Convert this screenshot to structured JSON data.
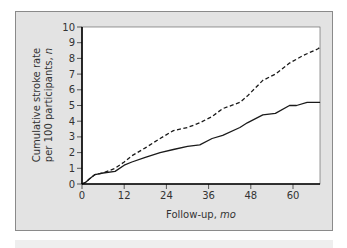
{
  "chart_data": {
    "type": "line",
    "title": "",
    "xlabel": "Follow-up, mo",
    "xlabel_main": "Follow-up, ",
    "xlabel_unit": "mo",
    "ylabel": "Cumulative stroke rate per 100 participants, n",
    "ylabel_line1": "Cumulative stroke rate",
    "ylabel_line2_main": "per 100 participants, ",
    "ylabel_line2_unit": "n",
    "xlim": [
      0,
      68
    ],
    "ylim": [
      0,
      10
    ],
    "x_ticks": [
      0,
      12,
      24,
      36,
      48,
      60
    ],
    "y_ticks": [
      0,
      1,
      2,
      3,
      4,
      5,
      6,
      7,
      8,
      9,
      10
    ],
    "grid": false,
    "legend": "none",
    "series": [
      {
        "name": "dashed",
        "style": "dashed",
        "x": [
          0,
          1,
          2,
          3.7,
          6,
          9.4,
          12,
          14.2,
          18,
          22.2,
          26,
          30,
          33.5,
          37,
          40,
          44.9,
          47,
          51.4,
          55,
          59,
          63,
          67,
          67.7
        ],
        "y": [
          0,
          0.1,
          0.3,
          0.6,
          0.7,
          1.0,
          1.4,
          1.8,
          2.3,
          2.9,
          3.4,
          3.6,
          3.9,
          4.3,
          4.8,
          5.2,
          5.6,
          6.6,
          7.0,
          7.7,
          8.2,
          8.6,
          8.7
        ]
      },
      {
        "name": "solid",
        "style": "solid",
        "x": [
          0,
          1,
          2,
          3.7,
          6,
          9.4,
          12,
          14.2,
          18,
          22.2,
          26,
          30,
          33.5,
          37,
          40,
          44.9,
          47,
          51.4,
          55,
          59,
          61,
          64,
          67.7
        ],
        "y": [
          0,
          0.1,
          0.3,
          0.6,
          0.7,
          0.8,
          1.2,
          1.4,
          1.7,
          2.0,
          2.2,
          2.4,
          2.5,
          2.9,
          3.1,
          3.6,
          3.9,
          4.4,
          4.5,
          5.0,
          5.0,
          5.2,
          5.2
        ]
      }
    ]
  },
  "colors": {
    "panel_background": "#e3e3e3",
    "plot_background": "#ffffff",
    "line": "#1a1a1a"
  }
}
